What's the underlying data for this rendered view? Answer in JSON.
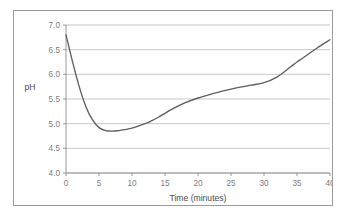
{
  "chart_data": {
    "type": "line",
    "title": "",
    "xlabel": "Time (minutes)",
    "ylabel": "pH",
    "xlim": [
      0,
      40
    ],
    "ylim": [
      4.0,
      7.0
    ],
    "xticks": [
      0,
      5,
      10,
      15,
      20,
      25,
      30,
      35,
      40
    ],
    "xtick_labels": [
      "0",
      "5",
      "10",
      "15",
      "20",
      "25",
      "30",
      "35",
      "40"
    ],
    "yticks": [
      4.0,
      4.5,
      5.0,
      5.5,
      6.0,
      6.5,
      7.0
    ],
    "ytick_labels": [
      "4.0",
      "4.5",
      "5.0",
      "5.5",
      "6.0",
      "6.5",
      "7.0"
    ],
    "grid": "horizontal",
    "legend": "none",
    "series": [
      {
        "name": "pH",
        "x": [
          0,
          1,
          2,
          3,
          4,
          5,
          6,
          7,
          8,
          10,
          12,
          13,
          14,
          15,
          16,
          18,
          20,
          22,
          24,
          25,
          26,
          28,
          30,
          32,
          34,
          35,
          36,
          38,
          40
        ],
        "y": [
          6.8,
          6.25,
          5.75,
          5.35,
          5.08,
          4.92,
          4.86,
          4.85,
          4.86,
          4.91,
          5.0,
          5.06,
          5.13,
          5.21,
          5.29,
          5.42,
          5.52,
          5.6,
          5.67,
          5.7,
          5.73,
          5.78,
          5.83,
          5.95,
          6.15,
          6.25,
          6.34,
          6.53,
          6.7
        ]
      }
    ],
    "annotations": []
  },
  "axis_titles": {
    "x": "Time (minutes)",
    "y": "pH"
  },
  "colors": {
    "curve": "#5e5e5e",
    "grid": "#b9b9b9",
    "axis": "#8d8d8d",
    "tick_text": "#7d7d7d",
    "title_text": "#4a4a4a",
    "frame": "#9a9a9a",
    "background": "#ffffff"
  }
}
